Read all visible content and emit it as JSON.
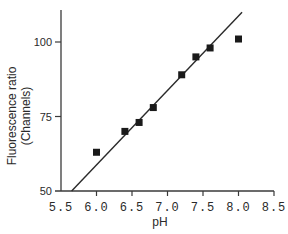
{
  "chart_data": {
    "type": "scatter",
    "title": "",
    "xlabel": "pH",
    "ylabel_line1": "Fluorescence ratio",
    "ylabel_line2": "(Channels)",
    "xlim": [
      5.5,
      8.5
    ],
    "ylim": [
      50,
      110
    ],
    "x_ticks": [
      5.5,
      6.0,
      6.5,
      7.0,
      7.5,
      8.0,
      8.5
    ],
    "x_tick_labels": [
      "5.5",
      "6.0",
      "6.5",
      "7.0",
      "7.5",
      "8.0",
      "8.5"
    ],
    "y_ticks": [
      50,
      75,
      100
    ],
    "y_tick_labels": [
      "50",
      "75",
      "100"
    ],
    "grid": false,
    "legend": null,
    "series": [
      {
        "name": "measured",
        "marker": "square",
        "color": "#1a1a1a",
        "x": [
          6.0,
          6.4,
          6.6,
          6.8,
          7.2,
          7.4,
          7.6,
          8.0
        ],
        "y": [
          63,
          70,
          73,
          78,
          89,
          95,
          98,
          101
        ]
      }
    ],
    "fit_line": {
      "name": "linear fit",
      "color": "#2a2a2a",
      "x": [
        5.65,
        8.05
      ],
      "y": [
        50,
        110
      ]
    }
  }
}
